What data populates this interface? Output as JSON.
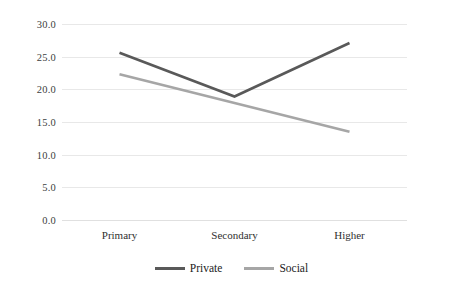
{
  "chart_data": {
    "type": "line",
    "title": "",
    "xlabel": "",
    "ylabel": "",
    "categories": [
      "Primary",
      "Secondary",
      "Higher"
    ],
    "ylim": [
      0.0,
      30.0
    ],
    "yticks": [
      0.0,
      5.0,
      10.0,
      15.0,
      20.0,
      25.0,
      30.0
    ],
    "ytick_labels": [
      "0.0",
      "5.0",
      "10.0",
      "15.0",
      "20.0",
      "25.0",
      "30.0"
    ],
    "grid": true,
    "legend_position": "bottom-center",
    "series": [
      {
        "name": "Private",
        "values": [
          25.6,
          18.9,
          27.1
        ],
        "color": "#595959"
      },
      {
        "name": "Social",
        "values": [
          22.3,
          17.9,
          13.5
        ],
        "color": "#a6a6a6"
      }
    ]
  },
  "legend": {
    "items": [
      {
        "label": "Private",
        "swatch_name": "legend-swatch-private"
      },
      {
        "label": "Social",
        "swatch_name": "legend-swatch-social"
      }
    ]
  }
}
